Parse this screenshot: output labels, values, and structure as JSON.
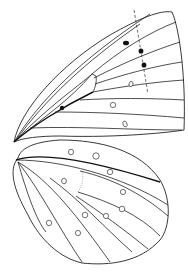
{
  "figure": {
    "colors": {
      "line": "#222222",
      "spot_fill": "#111111",
      "background": "#ffffff"
    },
    "forewing": {
      "filled_spots": 4,
      "open_spots": 3,
      "has_dashed_reference_line": true
    },
    "hindwing": {
      "filled_spots": 0,
      "open_spots": 12
    }
  }
}
